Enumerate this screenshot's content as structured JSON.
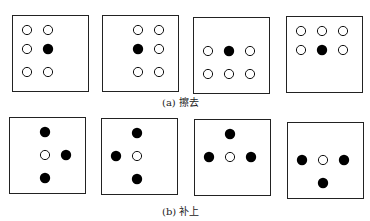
{
  "panels": [
    {
      "id": "a",
      "caption": "(a) 擦去",
      "patterns": [
        [
          [
            "o",
            "o",
            ""
          ],
          [
            "o",
            "x",
            ""
          ],
          [
            "o",
            "o",
            ""
          ]
        ],
        [
          [
            "",
            "o",
            "o"
          ],
          [
            "",
            "x",
            "o"
          ],
          [
            "",
            "o",
            "o"
          ]
        ],
        [
          [
            "",
            "",
            ""
          ],
          [
            "o",
            "x",
            "o"
          ],
          [
            "o",
            "o",
            "o"
          ]
        ],
        [
          [
            "o",
            "o",
            "o"
          ],
          [
            "o",
            "x",
            "o"
          ],
          [
            "",
            "",
            ""
          ]
        ]
      ]
    },
    {
      "id": "b",
      "caption": "(b) 补上",
      "patterns": [
        [
          [
            "",
            "x",
            ""
          ],
          [
            "",
            "o",
            "x"
          ],
          [
            "",
            "x",
            ""
          ]
        ],
        [
          [
            "",
            "x",
            ""
          ],
          [
            "x",
            "o",
            ""
          ],
          [
            "",
            "x",
            ""
          ]
        ],
        [
          [
            "",
            "x",
            ""
          ],
          [
            "x",
            "o",
            "x"
          ],
          [
            "",
            "",
            ""
          ]
        ],
        [
          [
            "",
            "",
            ""
          ],
          [
            "x",
            "o",
            "x"
          ],
          [
            "",
            "x",
            ""
          ]
        ]
      ]
    }
  ],
  "legend": {
    "o": "open-pixel",
    "x": "filled-pixel"
  }
}
